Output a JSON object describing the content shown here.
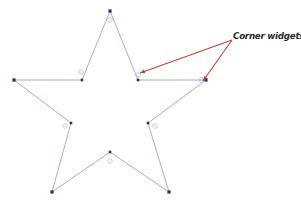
{
  "figure": {
    "title_fragment_row": {
      "fragments": [
        "—",
        "·",
        "·",
        "·"
      ]
    },
    "callout": {
      "label": "Corner widgets",
      "color": "#c0452a"
    },
    "shape": {
      "name": "five-pointed-star",
      "stroke_color": "#9a93c8",
      "stroke_width": 0.8,
      "fill": "none",
      "outer_vertex_handle_color": "#2f2f6e",
      "inner_widget_circle_color": "#b9b4c9"
    },
    "geometry": {
      "outer_points": [
        {
          "name": "top-point",
          "x": 110,
          "y": 11
        },
        {
          "name": "right-point",
          "x": 206,
          "y": 80
        },
        {
          "name": "bottom-right-point",
          "x": 169,
          "y": 192
        },
        {
          "name": "bottom-left-point",
          "x": 52,
          "y": 192
        },
        {
          "name": "left-point",
          "x": 14,
          "y": 80
        }
      ],
      "inner_points": [
        {
          "name": "inner-upper-right",
          "x": 138,
          "y": 80
        },
        {
          "name": "inner-lower-right",
          "x": 148,
          "y": 123
        },
        {
          "name": "inner-bottom",
          "x": 110,
          "y": 152
        },
        {
          "name": "inner-lower-left",
          "x": 71,
          "y": 123
        },
        {
          "name": "inner-upper-left",
          "x": 82,
          "y": 80
        }
      ],
      "corner_widgets": [
        {
          "name": "widget-top",
          "x": 110,
          "y": 20
        },
        {
          "name": "widget-upper-left",
          "x": 81,
          "y": 72
        },
        {
          "name": "widget-lower-left",
          "x": 65,
          "y": 126
        },
        {
          "name": "widget-bottom",
          "x": 110,
          "y": 161
        },
        {
          "name": "widget-lower-right",
          "x": 155,
          "y": 126
        },
        {
          "name": "widget-upper-right-inner",
          "x": 138,
          "y": 75
        },
        {
          "name": "widget-right-point",
          "x": 201,
          "y": 80
        }
      ],
      "leader_lines": [
        {
          "name": "leader-to-inner-corner",
          "x1": 232,
          "y1": 40,
          "x2": 140,
          "y2": 73
        },
        {
          "name": "leader-to-right-point",
          "x1": 232,
          "y1": 40,
          "x2": 203,
          "y2": 81
        }
      ]
    }
  }
}
